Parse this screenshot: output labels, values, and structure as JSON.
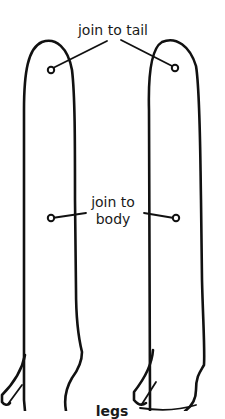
{
  "diagram": {
    "labels": {
      "join_tail": "join to tail",
      "join_body_line1": "join to",
      "join_body_line2": "body",
      "piece_name": "legs"
    },
    "pieces": [
      {
        "name": "left-leg",
        "markers": [
          "tail-joint",
          "body-joint"
        ]
      },
      {
        "name": "right-leg",
        "markers": [
          "tail-joint",
          "body-joint"
        ]
      }
    ],
    "colors": {
      "ink": "#111111",
      "background": "#ffffff"
    }
  }
}
